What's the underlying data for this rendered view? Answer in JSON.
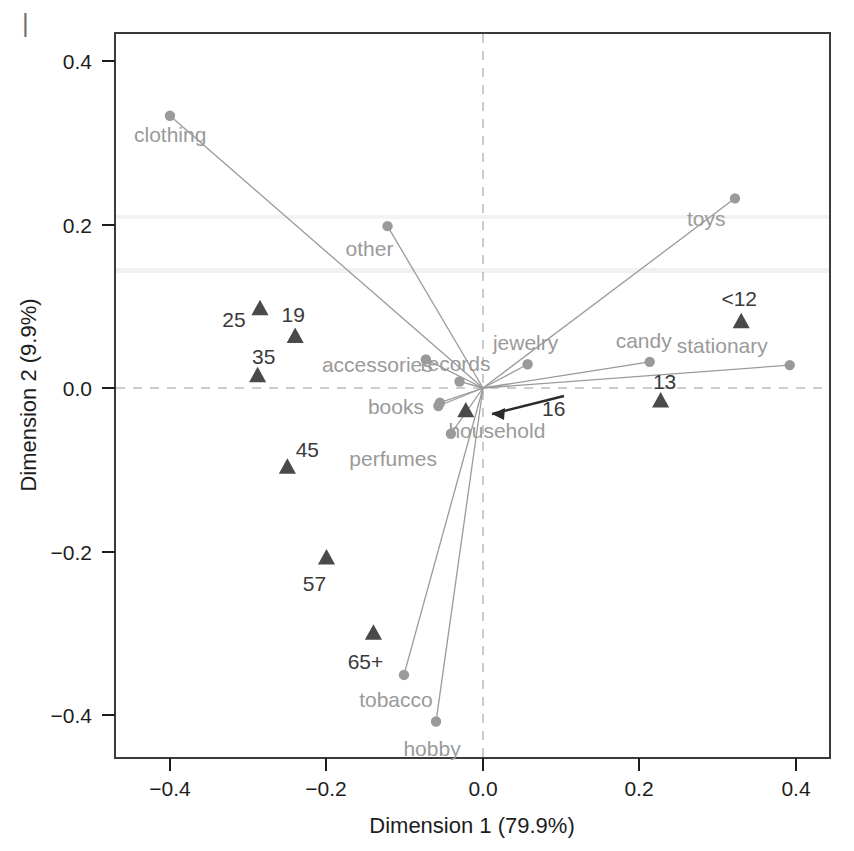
{
  "figure": {
    "corner_mark": "|",
    "background": "#ffffff"
  },
  "axes": {
    "x_title": "Dimension 1 (79.9%)",
    "y_title": "Dimension 2 (9.9%)",
    "x_ticks": [
      "−0.4",
      "−0.2",
      "0.0",
      "0.2",
      "0.4"
    ],
    "y_ticks": [
      "0.4",
      "0.2",
      "0.0",
      "−0.2",
      "−0.4"
    ],
    "frame_color": "#3a3a3a",
    "guide_color": "#bdbdbd"
  },
  "chart_data": {
    "type": "scatter",
    "title": "",
    "subtitle": "",
    "xlabel": "Dimension 1 (79.9%)",
    "ylabel": "Dimension 2 (9.9%)",
    "xlim": [
      -0.47,
      0.445
    ],
    "ylim": [
      -0.445,
      0.435
    ],
    "xticks": [
      -0.4,
      -0.2,
      0.0,
      0.2,
      0.4
    ],
    "yticks": [
      -0.4,
      -0.2,
      0.0,
      0.2,
      0.4
    ],
    "grid": false,
    "reference_lines": {
      "x": 0.0,
      "y": 0.0,
      "style": "dashed"
    },
    "legend": "none",
    "series": [
      {
        "name": "Merchandise category (column points)",
        "marker": "circle",
        "color": "#9a9a9a",
        "connected_to_origin": true,
        "points": [
          {
            "label": "clothing",
            "x": -0.4,
            "y": 0.333
          },
          {
            "label": "other",
            "x": -0.122,
            "y": 0.198
          },
          {
            "label": "toys",
            "x": 0.322,
            "y": 0.232
          },
          {
            "label": "accessories",
            "x": -0.073,
            "y": 0.035
          },
          {
            "label": "jewelry",
            "x": 0.057,
            "y": 0.029
          },
          {
            "label": "candy",
            "x": 0.213,
            "y": 0.032
          },
          {
            "label": "stationary",
            "x": 0.392,
            "y": 0.028
          },
          {
            "label": "records",
            "x": -0.03,
            "y": 0.008
          },
          {
            "label": "books",
            "x": -0.055,
            "y": -0.018
          },
          {
            "label": "household",
            "x": -0.057,
            "y": -0.022
          },
          {
            "label": "perfumes",
            "x": -0.041,
            "y": -0.056
          },
          {
            "label": "tobacco",
            "x": -0.101,
            "y": -0.351
          },
          {
            "label": "hobby",
            "x": -0.06,
            "y": -0.408
          }
        ]
      },
      {
        "name": "Age group (row points)",
        "marker": "triangle",
        "color": "#4a4a4a",
        "connected_to_origin": false,
        "points": [
          {
            "label": "<12",
            "x": 0.33,
            "y": 0.081
          },
          {
            "label": "13",
            "x": 0.227,
            "y": -0.016
          },
          {
            "label": "16",
            "x": -0.022,
            "y": -0.028
          },
          {
            "label": "19",
            "x": -0.24,
            "y": 0.063
          },
          {
            "label": "25",
            "x": -0.285,
            "y": 0.097
          },
          {
            "label": "35",
            "x": -0.288,
            "y": 0.015
          },
          {
            "label": "45",
            "x": -0.25,
            "y": -0.097
          },
          {
            "label": "57",
            "x": -0.2,
            "y": -0.208
          },
          {
            "label": "65+",
            "x": -0.14,
            "y": -0.3
          }
        ]
      }
    ],
    "annotations": [
      {
        "text": "16",
        "type": "leader-arrow",
        "points_to": "row point 16"
      }
    ]
  }
}
